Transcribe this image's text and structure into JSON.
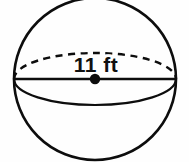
{
  "figure": {
    "name": "sphere-with-labeled-diameter",
    "shape": "sphere",
    "background_color": "#fefefe",
    "line_color": "#0d0d0d"
  },
  "measurement": {
    "label": "11 ft",
    "value": 11,
    "unit": "ft",
    "measures": "diameter"
  },
  "geometry": {
    "circle": {
      "cx": 95,
      "cy": 79,
      "r": 81
    },
    "equator_ellipse": {
      "cx": 95,
      "cy": 79,
      "rx": 81,
      "ry": 26
    },
    "diameter_line": {
      "x1": 14,
      "y1": 79,
      "x2": 176,
      "y2": 79
    },
    "center_dot": {
      "cx": 95,
      "cy": 79,
      "r": 5.2
    },
    "label_position": {
      "x": 96,
      "y": 72
    }
  },
  "parts": {
    "outline_name": "sphere-outline",
    "back_arc_name": "equator-back-arc-dashed",
    "front_arc_name": "equator-front-arc-solid",
    "diameter_name": "diameter-line",
    "center_name": "center-point",
    "label_name": "diameter-label"
  }
}
